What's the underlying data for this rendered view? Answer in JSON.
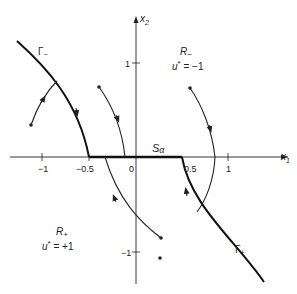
{
  "axes": {
    "x_label": "x",
    "x_sub": "1",
    "y_label": "x",
    "y_sub": "2",
    "x_ticks": [
      "−1",
      "−0.5",
      "0",
      "0.5",
      "1"
    ],
    "y_ticks": [
      "1",
      "−1"
    ]
  },
  "regions": {
    "r_minus": {
      "name": "R",
      "sub": "−",
      "control": "u",
      "sup": "*",
      "value": " = −1"
    },
    "r_plus": {
      "name": "R",
      "sub": "+",
      "control": "u",
      "sup": "*",
      "value": " = +1"
    }
  },
  "curves": {
    "gamma_minus": {
      "name": "Γ",
      "sub": "−"
    },
    "gamma_plus": {
      "name": "Γ",
      "sub": "+"
    },
    "singular": {
      "name": "S",
      "sub": "α"
    }
  },
  "colors": {
    "ink": "#222222",
    "background": "#ffffff"
  }
}
